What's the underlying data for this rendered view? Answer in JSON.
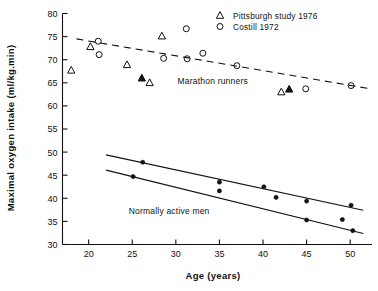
{
  "chart_data": {
    "type": "scatter",
    "title": "",
    "xlabel": "Age (years)",
    "ylabel": "Maximal oxygen intake (ml/kg.min)",
    "xlim": [
      17,
      52.5
    ],
    "ylim": [
      30,
      80
    ],
    "xticks": [
      20,
      25,
      30,
      35,
      40,
      45,
      50
    ],
    "yticks": [
      30,
      35,
      40,
      45,
      50,
      55,
      60,
      65,
      70,
      75,
      80
    ],
    "grid": false,
    "legend_position": "top-right",
    "legend": [
      {
        "marker": "open-triangle",
        "label": "Pittsburgh study 1976"
      },
      {
        "marker": "open-circle",
        "label": "Costill 1972"
      }
    ],
    "annotations": [
      {
        "text": "Marathon runners",
        "x": 30.2,
        "y": 65.3
      },
      {
        "text": "Normally active men",
        "x": 24.6,
        "y": 37.3
      }
    ],
    "series": [
      {
        "name": "Pittsburgh study 1976",
        "marker": "open-triangle",
        "points": [
          {
            "x": 18.0,
            "y": 67.7
          },
          {
            "x": 20.2,
            "y": 72.8
          },
          {
            "x": 24.4,
            "y": 68.9
          },
          {
            "x": 28.4,
            "y": 75.1
          },
          {
            "x": 27.0,
            "y": 65.0
          },
          {
            "x": 42.1,
            "y": 63.0
          }
        ]
      },
      {
        "name": "Pittsburgh study 1976 (filled)",
        "marker": "filled-triangle",
        "points": [
          {
            "x": 26.1,
            "y": 66.0
          },
          {
            "x": 43.0,
            "y": 63.6
          }
        ]
      },
      {
        "name": "Costill 1972",
        "marker": "open-circle",
        "points": [
          {
            "x": 21.1,
            "y": 74.0
          },
          {
            "x": 21.2,
            "y": 71.1
          },
          {
            "x": 28.6,
            "y": 70.3
          },
          {
            "x": 31.2,
            "y": 76.7
          },
          {
            "x": 31.3,
            "y": 70.2
          },
          {
            "x": 33.1,
            "y": 71.4
          },
          {
            "x": 37.0,
            "y": 68.7
          },
          {
            "x": 44.9,
            "y": 63.7
          },
          {
            "x": 50.1,
            "y": 64.4
          }
        ]
      },
      {
        "name": "Normally active men (upper)",
        "marker": "filled-circle",
        "points": [
          {
            "x": 26.2,
            "y": 47.8
          },
          {
            "x": 35.0,
            "y": 43.5
          },
          {
            "x": 40.1,
            "y": 42.5
          },
          {
            "x": 41.5,
            "y": 40.2
          },
          {
            "x": 45.0,
            "y": 39.4
          },
          {
            "x": 50.1,
            "y": 38.5
          }
        ]
      },
      {
        "name": "Normally active men (lower)",
        "marker": "filled-circle",
        "points": [
          {
            "x": 25.1,
            "y": 44.7
          },
          {
            "x": 35.0,
            "y": 41.6
          },
          {
            "x": 45.0,
            "y": 35.3
          },
          {
            "x": 49.1,
            "y": 35.4
          },
          {
            "x": 50.3,
            "y": 33.0
          }
        ]
      }
    ],
    "fit_lines": [
      {
        "name": "marathon-runners-fit",
        "style": "dashed",
        "x1": 18.6,
        "y1": 74.5,
        "x2": 52.0,
        "y2": 63.8
      },
      {
        "name": "normally-active-upper-fit",
        "style": "solid",
        "x1": 22.0,
        "y1": 49.4,
        "x2": 51.5,
        "y2": 37.4
      },
      {
        "name": "normally-active-lower-fit",
        "style": "solid",
        "x1": 22.0,
        "y1": 46.1,
        "x2": 51.5,
        "y2": 32.4
      }
    ]
  }
}
